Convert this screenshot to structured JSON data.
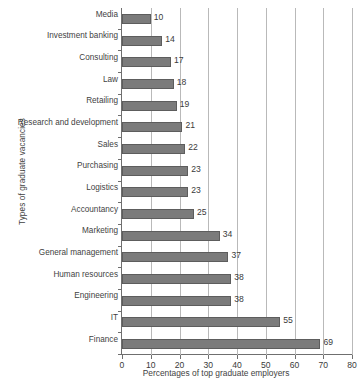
{
  "chart_data": {
    "type": "bar",
    "orientation": "horizontal",
    "title": "",
    "xlabel": "Percentages of top graduate employers",
    "ylabel": "Types of graduate vacancies",
    "xlim": [
      0,
      80
    ],
    "xticks": [
      0,
      10,
      20,
      30,
      40,
      50,
      60,
      70,
      80
    ],
    "grid": "vertical",
    "legend": "none",
    "bar_color": "#7b7b7b",
    "bar_border_color": "#5d5d5d",
    "axis_color": "#6f6f6f",
    "gridline_color": "#b9b9b9",
    "categories": [
      "Media",
      "Investment banking",
      "Consulting",
      "Law",
      "Retailing",
      "Research and development",
      "Sales",
      "Purchasing",
      "Logistics",
      "Accountancy",
      "Marketing",
      "General management",
      "Human resources",
      "Engineering",
      "IT",
      "Finance"
    ],
    "values": [
      10,
      14,
      17,
      18,
      19,
      21,
      22,
      23,
      23,
      25,
      34,
      37,
      38,
      38,
      55,
      69
    ],
    "data_labels": [
      "10",
      "14",
      "17",
      "18",
      "19",
      "21",
      "22",
      "23",
      "23",
      "25",
      "34",
      "37",
      "38",
      "38",
      "55",
      "69"
    ],
    "tick_labels": [
      "0",
      "10",
      "20",
      "30",
      "40",
      "50",
      "60",
      "70",
      "80"
    ]
  }
}
